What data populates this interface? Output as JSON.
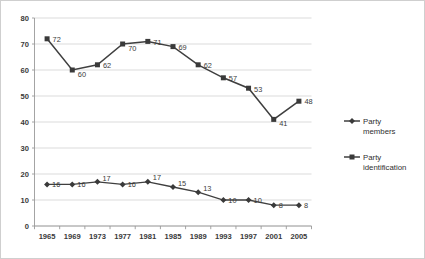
{
  "chart_data": {
    "type": "line",
    "title": "",
    "xlabel": "",
    "ylabel": "",
    "ylim": [
      0,
      80
    ],
    "ytick_step": 10,
    "grid": true,
    "legend_position": "right",
    "categories": [
      "1965",
      "1969",
      "1973",
      "1977",
      "1981",
      "1985",
      "1989",
      "1993",
      "1997",
      "2001",
      "2005"
    ],
    "yticks": [
      "0",
      "10",
      "20",
      "30",
      "40",
      "50",
      "60",
      "70",
      "80"
    ],
    "series": [
      {
        "name": "Party identification",
        "marker": "square",
        "color": "#3a3a3a",
        "values": [
          72,
          60,
          62,
          70,
          71,
          69,
          62,
          57,
          53,
          41,
          48
        ]
      },
      {
        "name": "Party members",
        "marker": "diamond",
        "color": "#3a3a3a",
        "values": [
          16,
          16,
          17,
          16,
          17,
          15,
          13,
          10,
          10,
          8,
          8
        ]
      }
    ],
    "data_labels": {
      "party_identification": [
        "72",
        "60",
        "62",
        "70",
        "71",
        "69",
        "62",
        "57",
        "53",
        "41",
        "48"
      ],
      "party_members": [
        "16",
        "16",
        "17",
        "16",
        "17",
        "15",
        "13",
        "10",
        "10",
        "8",
        "8"
      ]
    }
  },
  "legend": {
    "entries": [
      {
        "label_line1": "Party",
        "label_line2": "members",
        "marker": "diamond"
      },
      {
        "label_line1": "Party",
        "label_line2": "identification",
        "marker": "square"
      }
    ]
  }
}
